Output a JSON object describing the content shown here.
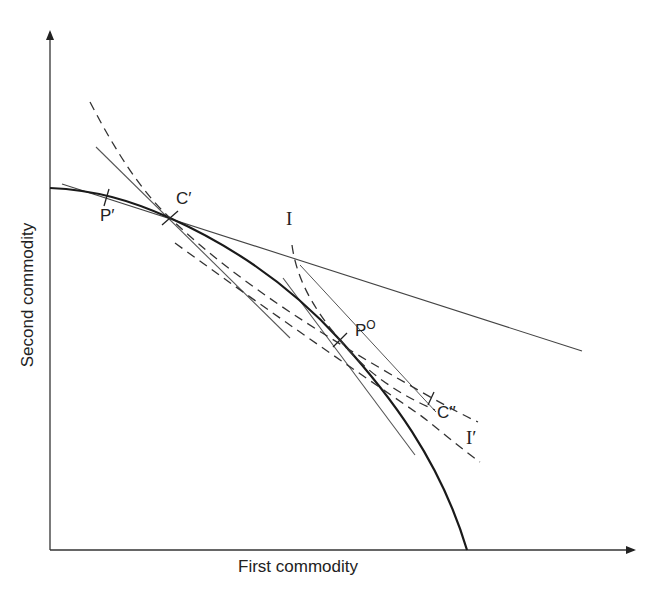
{
  "diagram": {
    "type": "production possibility frontier with indifference curves and price lines",
    "axes": {
      "x_label": "First commodity",
      "y_label": "Second commodity"
    },
    "labels": {
      "p_prime": "P′",
      "c_prime": "C′",
      "i": "I",
      "p_zero": "P",
      "p_zero_sup": "O",
      "c_double_prime": "C′′",
      "i_prime": "I′"
    },
    "elements": [
      {
        "name": "production-frontier",
        "style": "thick solid",
        "color": "#1a1a1a"
      },
      {
        "name": "price-line-through-C-prime",
        "style": "thin solid",
        "color": "#444444"
      },
      {
        "name": "tangent-at-C-prime",
        "style": "thin solid",
        "color": "#555555"
      },
      {
        "name": "tangent-at-P-zero",
        "style": "thin solid",
        "color": "#555555"
      },
      {
        "name": "indifference-curve-through-C-prime",
        "style": "dashed",
        "color": "#333333"
      },
      {
        "name": "indifference-curve-I",
        "style": "dashed",
        "color": "#333333"
      },
      {
        "name": "indifference-curve-I-prime",
        "style": "dashed",
        "color": "#333333"
      }
    ]
  }
}
